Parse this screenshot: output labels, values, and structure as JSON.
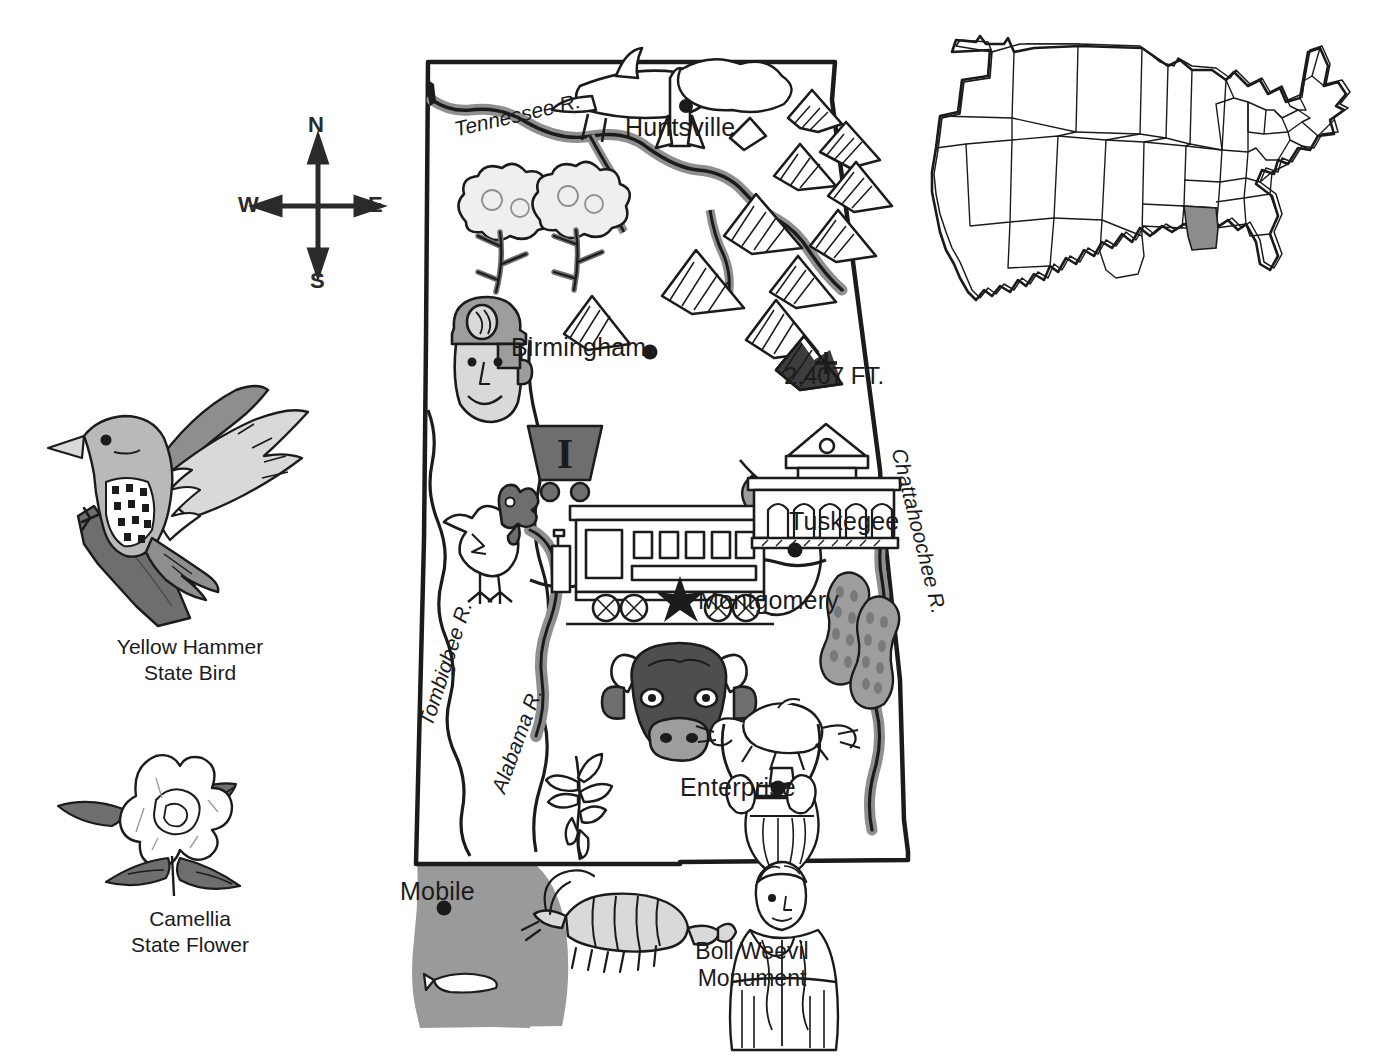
{
  "page": {
    "subject": "Alabama",
    "width": 1381,
    "height": 1060
  },
  "colors": {
    "ink": "#1b1b1b",
    "water_gray": "#8f8f8f",
    "bay_gray": "#9a9a9a",
    "fill_light": "#d9d9d9",
    "fill_mid": "#9d9d9d",
    "fill_dark": "#6e6e6e",
    "highlight_state": "#8c8c8c",
    "paper": "#ffffff"
  },
  "compass": {
    "north": "N",
    "south": "S",
    "east": "E",
    "west": "W"
  },
  "side_panels": [
    {
      "id": "bird",
      "icon": "yellowhammer-bird-icon",
      "caption_line1": "Yellow Hammer",
      "caption_line2": "State Bird"
    },
    {
      "id": "flower",
      "icon": "camellia-flower-icon",
      "caption_line1": "Camellia",
      "caption_line2": "State Flower"
    }
  ],
  "inset_map": {
    "name": "united-states-inset",
    "highlighted_state": "Alabama"
  },
  "map": {
    "cities": [
      {
        "name": "Huntsville",
        "marker": "dot"
      },
      {
        "name": "Birmingham",
        "marker": "dot"
      },
      {
        "name": "Tuskegee",
        "marker": "dot"
      },
      {
        "name": "Montgomery",
        "marker": "star"
      },
      {
        "name": "Enterprise",
        "marker": "dot"
      },
      {
        "name": "Mobile",
        "marker": "dot"
      }
    ],
    "rivers": [
      {
        "name": "Tennessee R."
      },
      {
        "name": "Tombigbee R."
      },
      {
        "name": "Alabama R."
      },
      {
        "name": "Chattahoochee R."
      }
    ],
    "elevation_marker": {
      "label": "2,407 FT.",
      "symbol": "+"
    },
    "landmark": {
      "line1": "Boll Weevil",
      "line2": "Monument"
    },
    "illustrations": [
      {
        "name": "airplane-icon"
      },
      {
        "name": "rocket-icon"
      },
      {
        "name": "mountains-icon"
      },
      {
        "name": "cotton-plant-icon"
      },
      {
        "name": "coal-miner-icon"
      },
      {
        "name": "coal-cart-icon"
      },
      {
        "name": "chicken-icon"
      },
      {
        "name": "trolley-car-icon"
      },
      {
        "name": "tuskegee-building-icon"
      },
      {
        "name": "peanuts-icon"
      },
      {
        "name": "cow-head-icon"
      },
      {
        "name": "soybean-plant-icon"
      },
      {
        "name": "shrimp-icon"
      },
      {
        "name": "boll-weevil-monument-icon"
      },
      {
        "name": "fish-icon"
      }
    ]
  }
}
